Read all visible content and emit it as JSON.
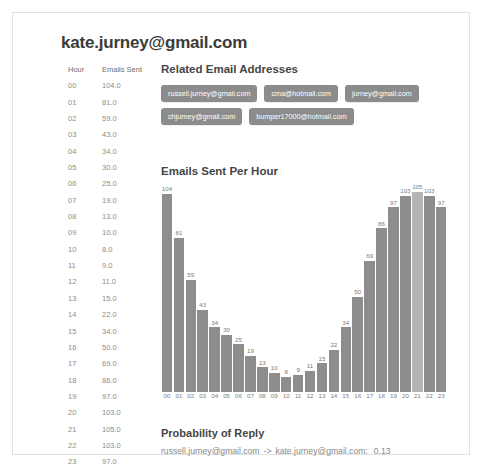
{
  "header": {
    "title": "kate.jurney@gmail.com"
  },
  "table": {
    "columns": [
      "Hour",
      "Emails Sent"
    ],
    "rows": [
      {
        "hour": "00",
        "sent": "104.0"
      },
      {
        "hour": "01",
        "sent": "81.0"
      },
      {
        "hour": "02",
        "sent": "59.0"
      },
      {
        "hour": "03",
        "sent": "43.0"
      },
      {
        "hour": "04",
        "sent": "34.0"
      },
      {
        "hour": "05",
        "sent": "30.0"
      },
      {
        "hour": "06",
        "sent": "25.0"
      },
      {
        "hour": "07",
        "sent": "19.0"
      },
      {
        "hour": "08",
        "sent": "13.0"
      },
      {
        "hour": "09",
        "sent": "10.0"
      },
      {
        "hour": "10",
        "sent": "8.0"
      },
      {
        "hour": "11",
        "sent": "9.0"
      },
      {
        "hour": "12",
        "sent": "11.0"
      },
      {
        "hour": "13",
        "sent": "15.0"
      },
      {
        "hour": "14",
        "sent": "22.0"
      },
      {
        "hour": "15",
        "sent": "34.0"
      },
      {
        "hour": "16",
        "sent": "50.0"
      },
      {
        "hour": "17",
        "sent": "69.0"
      },
      {
        "hour": "18",
        "sent": "86.0"
      },
      {
        "hour": "19",
        "sent": "97.0"
      },
      {
        "hour": "20",
        "sent": "103.0"
      },
      {
        "hour": "21",
        "sent": "105.0"
      },
      {
        "hour": "22",
        "sent": "103.0"
      },
      {
        "hour": "23",
        "sent": "97.0"
      }
    ]
  },
  "related": {
    "heading": "Related Email Addresses",
    "addresses": [
      "russell.jurney@gmail.com",
      "cma@hotmail.com",
      "jurney@gmail.com",
      "chjurney@gmail.com",
      "bumper17000@hotmail.com"
    ]
  },
  "probability": {
    "heading": "Probability of Reply",
    "from": "russell.jurney@gmail.com",
    "arrow": "->",
    "to": "kate.jurney@gmail.com:",
    "value": "0.13"
  },
  "colors": {
    "bar": "#8d8d8d",
    "bar_highlight": "#b4b4b4",
    "tag": "#8c8c8c",
    "text_muted": "#8d8d8d",
    "heading": "#454545"
  },
  "chart_data": {
    "type": "bar",
    "title": "Emails Sent Per Hour",
    "xlabel": "",
    "ylabel": "",
    "grid": false,
    "legend": null,
    "ylim": [
      0,
      105
    ],
    "categories": [
      "00",
      "01",
      "02",
      "03",
      "04",
      "05",
      "06",
      "07",
      "08",
      "09",
      "10",
      "11",
      "12",
      "13",
      "14",
      "15",
      "16",
      "17",
      "18",
      "19",
      "20",
      "21",
      "22",
      "23"
    ],
    "values": [
      104,
      81,
      59,
      43,
      34,
      30,
      25,
      19,
      13,
      10,
      8,
      9,
      11,
      15,
      22,
      34,
      50,
      69,
      86,
      97,
      103,
      105,
      103,
      97
    ],
    "data_labels": [
      "104",
      "81",
      "59",
      "43",
      "34",
      "30",
      "25",
      "19",
      "13",
      "10",
      "8",
      "9",
      "11",
      "15",
      "22",
      "34",
      "50",
      "69",
      "86",
      "97",
      "103",
      "105",
      "103",
      "97"
    ],
    "highlight_index": 21
  }
}
